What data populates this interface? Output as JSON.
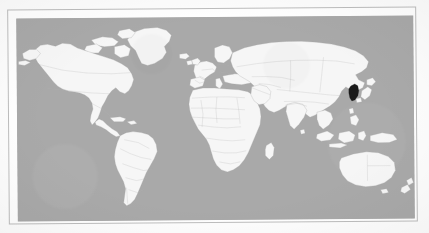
{
  "figure": {
    "type": "world-locator-map",
    "projection": "equirectangular",
    "frame": {
      "visible": true,
      "border_color": "#bdbdbd",
      "mat_color": "#ffffff"
    },
    "colors": {
      "ocean": "#a9a9a9",
      "land": "#f6f6f6",
      "country_border": "#b3b3b3",
      "coastline": "#a9a9a9",
      "highlight": "#1b1b1b",
      "page_background": "#fdfdfd"
    },
    "legend": {
      "visible": false,
      "entries": []
    },
    "labels": {
      "visible": false,
      "items": []
    },
    "graticule": {
      "visible": false
    },
    "title": "",
    "caption": "",
    "highlighted_regions": [
      {
        "name": "Korean Peninsula",
        "fill": "#1b1b1b",
        "approx_pixel_center": {
          "x": 340,
          "y": 105
        }
      }
    ],
    "continents_shown": [
      "North America",
      "South America",
      "Europe",
      "Africa",
      "Asia",
      "Australia",
      "Greenland"
    ]
  }
}
